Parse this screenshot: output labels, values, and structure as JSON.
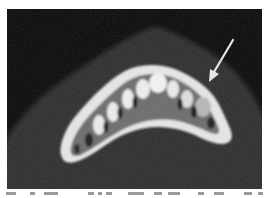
{
  "figure": {
    "kind": "axial CT scan of mandible",
    "background_color": "#050505",
    "soft_tissue_color": "#2a2a2a",
    "bone_color": "#f2f2f2",
    "arrow": {
      "color": "#e6e6e6",
      "from": [
        226,
        31
      ],
      "to": [
        203,
        71
      ]
    }
  },
  "caption": {
    "visible": true,
    "legible": false
  }
}
